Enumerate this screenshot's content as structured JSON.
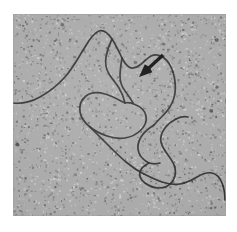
{
  "figure": {
    "kind": "electron-micrograph",
    "caption": "",
    "panel_label": "",
    "background_color": "#ffffff",
    "plate": {
      "x": 13,
      "y": 14,
      "width": 213,
      "height": 202,
      "base_gray": "#a9a9a9",
      "grain_dark": "#3c3c3c",
      "grain_light": "#e6e6e6",
      "grain_density": 2600
    }
  },
  "annotations": {
    "arrow": {
      "name": "pointer-arrow",
      "color": "#101010",
      "tail_x": 150,
      "tail_y": 41,
      "tip_x": 126,
      "tip_y": 63,
      "shaft_width": 3.2,
      "head_length": 13,
      "head_width": 11,
      "points_to": "branch-point"
    }
  },
  "specimen": {
    "name": "dna-filament",
    "stroke_color": "#2a2a2a",
    "stroke_width": 1.7,
    "description": "contoured nucleic acid strand with loops and a branch point",
    "strands": [
      {
        "id": "main-strand-upper",
        "d": "M 0 89 C 9 90 18 88 27 83 C 36 78 44 72 52 63 C 60 54 65 44 72 33 C 76 26 81 19 86 17 C 91 15 95 19 99 25 C 103 31 106 38 109 44 C 111 48 113 51 116 53 C 119 55 123 54 127 51 C 131 48 134 44 138 42 C 142 40 147 41 151 44 C 155 47 158 52 160 58"
      },
      {
        "id": "bubble-left-arm",
        "d": "M 99 25 C 96 31 94 37 93 43 C 92 49 93 55 96 60 C 99 65 103 69 106 74 C 109 79 111 84 112 89"
      },
      {
        "id": "bubble-right-arm",
        "d": "M 109 44 C 108 50 107 56 107 62 C 107 68 109 73 112 77 C 115 81 118 85 120 89"
      },
      {
        "id": "strand-descend-right",
        "d": "M 160 58 C 162 65 163 72 162 79 C 161 86 158 92 154 97 C 150 102 145 106 141 111"
      },
      {
        "id": "central-loop",
        "d": "M 112 89 C 106 86 99 82 92 80 C 85 78 78 78 73 82 C 68 86 66 92 67 98 C 68 104 72 109 77 113 C 82 117 88 120 94 122 C 100 124 106 125 112 124 C 118 123 124 120 128 116 C 132 112 134 107 133 102 C 132 97 128 93 123 91 C 119 89 115 88 112 89 Z"
      },
      {
        "id": "loop-tail-descend",
        "d": "M 77 113 C 83 119 89 125 95 131 C 101 137 107 143 113 148 C 119 153 125 157 131 160"
      },
      {
        "id": "serpentine-loop",
        "d": "M 141 111 C 136 114 131 118 128 123 C 125 128 124 134 126 139 C 128 144 132 147 136 149 C 132 151 128 154 127 158 C 126 162 128 166 132 169 C 136 172 141 174 146 174 C 151 174 156 172 159 168 C 162 164 163 159 162 154 C 161 149 158 145 155 141 C 152 137 149 133 148 128 C 147 123 149 118 152 114 C 155 110 159 107 163 105"
      },
      {
        "id": "serpentine-inner-kink",
        "d": "M 136 149 C 140 150 144 150 147 149"
      },
      {
        "id": "strand-exit-lower-right",
        "d": "M 131 160 C 137 163 143 166 149 168 C 155 170 161 171 167 170 C 173 169 179 166 184 163 C 189 160 194 158 199 159 C 204 160 207 164 209 169 C 211 174 212 180 212 186"
      },
      {
        "id": "strand-right-edge",
        "d": "M 163 105 C 167 103 171 102 175 103"
      }
    ]
  }
}
